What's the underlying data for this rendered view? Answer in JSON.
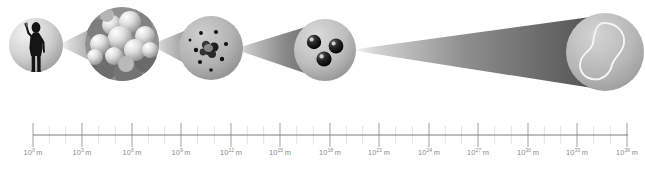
{
  "figure": {
    "name": "powers-of-ten-scale-diagram",
    "background_color": "#ffffff",
    "ink_color": "#8c8c8c",
    "axis": {
      "line_color": "#7d7d7d",
      "major_tick_color": "#9a9a9a",
      "minor_tick_color": "#d8d8d8",
      "unit": "m",
      "base": "10",
      "exponent_step": 3,
      "minor_ticks_between_majors": 2,
      "start_x": 33,
      "end_x": 628,
      "ticks": [
        {
          "exponent": "0",
          "label": "10",
          "unit": "m",
          "x": 33
        },
        {
          "exponent": "3",
          "label": "10",
          "unit": "m",
          "x": 82
        },
        {
          "exponent": "6",
          "label": "10",
          "unit": "m",
          "x": 132
        },
        {
          "exponent": "9",
          "label": "10",
          "unit": "m",
          "x": 181
        },
        {
          "exponent": "12",
          "label": "10",
          "unit": "m",
          "x": 231
        },
        {
          "exponent": "15",
          "label": "10",
          "unit": "m",
          "x": 280
        },
        {
          "exponent": "18",
          "label": "10",
          "unit": "m",
          "x": 330
        },
        {
          "exponent": "21",
          "label": "10",
          "unit": "m",
          "x": 379
        },
        {
          "exponent": "24",
          "label": "10",
          "unit": "m",
          "x": 429
        },
        {
          "exponent": "27",
          "label": "10",
          "unit": "m",
          "x": 478
        },
        {
          "exponent": "30",
          "label": "10",
          "unit": "m",
          "x": 528
        },
        {
          "exponent": "33",
          "label": "10",
          "unit": "m",
          "x": 577
        },
        {
          "exponent": "36",
          "label": "10",
          "unit": "m",
          "x": 627
        }
      ]
    },
    "scenes": [
      {
        "id": "human-scale",
        "icon": "human-silhouette-icon",
        "cx": 36,
        "cy": 45,
        "r": 27,
        "fill_light": "#e2e2e2",
        "fill_dark": "#9d9d9d"
      },
      {
        "id": "molecule-cluster-scale",
        "icon": "molecule-cluster-icon",
        "cx": 122,
        "cy": 44,
        "r": 37,
        "fill_light": "#efefef",
        "fill_dark": "#8e8e8e"
      },
      {
        "id": "atom-scale",
        "icon": "atom-icon",
        "cx": 211,
        "cy": 48,
        "r": 32,
        "fill_light": "#bdbdbd",
        "fill_dark": "#8a8a8a"
      },
      {
        "id": "quark-scale",
        "icon": "quark-triplet-icon",
        "cx": 325,
        "cy": 50,
        "r": 31,
        "fill_light": "#cfcfcf",
        "fill_dark": "#8f8f8f"
      },
      {
        "id": "string-scale",
        "icon": "string-loop-icon",
        "cx": 605,
        "cy": 52,
        "r": 39,
        "fill_light": "#c6c6c6",
        "fill_dark": "#9a9a9a"
      }
    ],
    "cones": [
      {
        "id": "cone-human-to-molecule",
        "from_scene": "human-scale",
        "to_scene": "molecule-cluster-scale"
      },
      {
        "id": "cone-molecule-to-atom",
        "from_scene": "molecule-cluster-scale",
        "to_scene": "atom-scale"
      },
      {
        "id": "cone-atom-to-quark",
        "from_scene": "atom-scale",
        "to_scene": "quark-scale"
      },
      {
        "id": "cone-quark-to-string",
        "from_scene": "quark-scale",
        "to_scene": "string-scale"
      }
    ]
  }
}
